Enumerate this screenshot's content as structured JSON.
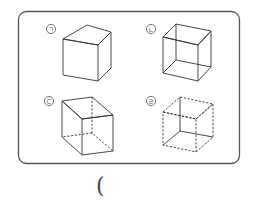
{
  "figure": {
    "frame": {
      "x": 18,
      "y": 11,
      "width": 221,
      "height": 152,
      "radius": 8,
      "stroke": "#555555"
    },
    "items": [
      {
        "id": "a",
        "label": "ㄱ",
        "style": "solid-opaque",
        "desc": "Cube with only visible edges drawn (hidden edges omitted)"
      },
      {
        "id": "b",
        "label": "ㄴ",
        "style": "solid-wireframe",
        "desc": "Cube with all edges drawn as solid lines"
      },
      {
        "id": "c",
        "label": "ㄷ",
        "style": "hidden-dashed",
        "desc": "Cube with visible edges solid and hidden edges dashed"
      },
      {
        "id": "d",
        "label": "ㄹ",
        "style": "visible-dashed",
        "desc": "Cube with visible edges dashed and hidden edges solid"
      }
    ]
  },
  "answer_blank": {
    "open_paren": "("
  }
}
